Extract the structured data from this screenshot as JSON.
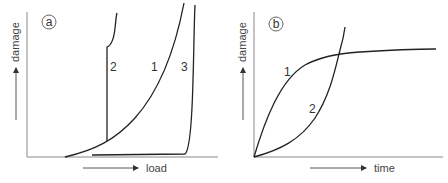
{
  "panels": [
    {
      "id": "a",
      "badge": "a",
      "ylabel": "damage",
      "xlabel": "load",
      "curves": [
        {
          "label": "1",
          "description": "smooth convex rise with load"
        },
        {
          "label": "2",
          "description": "follows curve 1 then abrupt vertical jump"
        },
        {
          "label": "3",
          "description": "near zero until high load then sharp rise"
        }
      ]
    },
    {
      "id": "b",
      "badge": "b",
      "ylabel": "damage",
      "xlabel": "time",
      "curves": [
        {
          "label": "1",
          "description": "fast initial rise, saturating plateau"
        },
        {
          "label": "2",
          "description": "slow initial rise, accelerating growth"
        }
      ]
    }
  ],
  "colors": {
    "curve": "#222222",
    "axis": "#888888",
    "text": "#333333"
  }
}
